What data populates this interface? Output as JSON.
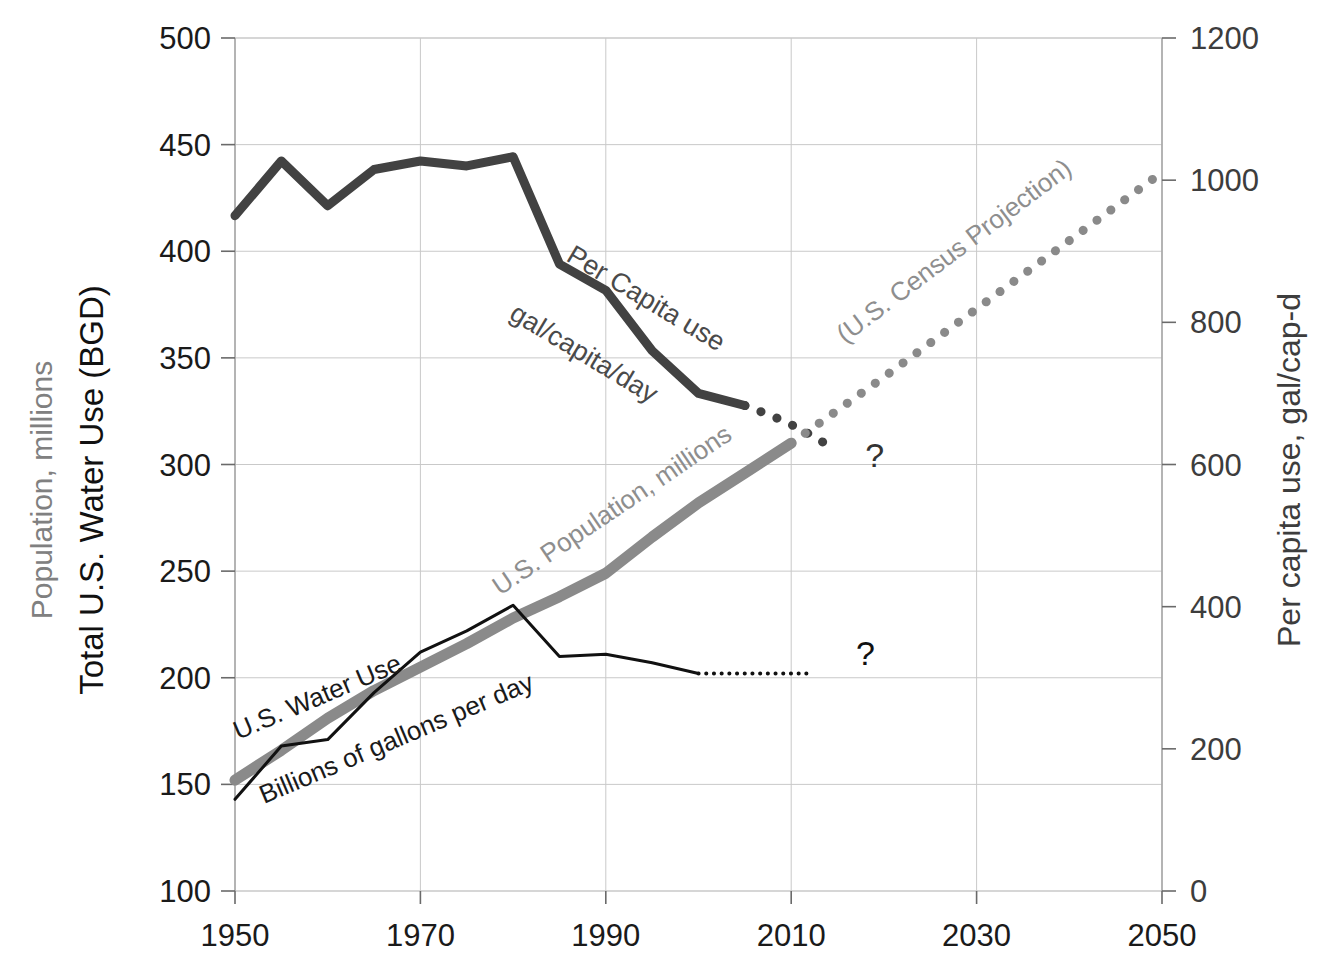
{
  "chart_data": {
    "type": "line",
    "title": "",
    "xlabel": "",
    "x_ticks": [
      "1950",
      "1970",
      "1990",
      "2010",
      "2030",
      "2050"
    ],
    "x_tick_values": [
      1950,
      1970,
      1990,
      2010,
      2030,
      2050
    ],
    "xlim": [
      1950,
      2050
    ],
    "grid": true,
    "legend": "inline-annotations",
    "axes": {
      "left": {
        "label_top": "Population, millions",
        "label_bottom": "Total U.S. Water Use (BGD)",
        "ticks": [
          "100",
          "150",
          "200",
          "250",
          "300",
          "350",
          "400",
          "450",
          "500"
        ],
        "tick_values": [
          100,
          150,
          200,
          250,
          300,
          350,
          400,
          450,
          500
        ],
        "ylim": [
          100,
          500
        ],
        "label_top_color": "#808080",
        "label_bottom_color": "#111111"
      },
      "right": {
        "label": "Per capita use, gal/cap-d",
        "ticks": [
          "0",
          "200",
          "400",
          "600",
          "800",
          "1000",
          "1200"
        ],
        "tick_values": [
          0,
          200,
          400,
          600,
          800,
          1000,
          1200
        ],
        "ylim": [
          0,
          1200
        ],
        "label_color": "#3d3d3d"
      }
    },
    "series": [
      {
        "name": "Per Capita use",
        "axis": "right",
        "units": "gal/capita/day",
        "color": "#424242",
        "style": "solid",
        "width": 9,
        "annotation_primary": "Per Capita use",
        "annotation_secondary": "gal/capita/day",
        "x": [
          1950,
          1955,
          1960,
          1965,
          1970,
          1975,
          1980,
          1985,
          1990,
          1995,
          2000,
          2005
        ],
        "values": [
          950,
          1027,
          964,
          1015,
          1027,
          1020,
          1033,
          882,
          845,
          760,
          700,
          683
        ]
      },
      {
        "name": "Per Capita use projection",
        "axis": "right",
        "color": "#424242",
        "style": "dotted",
        "width": 9,
        "x": [
          2005,
          2008,
          2011,
          2014
        ],
        "values": [
          683,
          668,
          650,
          627
        ]
      },
      {
        "name": "U.S. Population, millions",
        "axis": "left",
        "color": "#8a8a8a",
        "style": "solid",
        "width": 11,
        "annotation_primary": "U.S. Population, millions",
        "x": [
          1950,
          1955,
          1960,
          1965,
          1970,
          1975,
          1980,
          1985,
          1990,
          1995,
          2000,
          2005,
          2010
        ],
        "values": [
          152,
          166,
          181,
          194,
          205,
          216,
          228,
          238,
          249,
          266,
          282,
          296,
          310
        ]
      },
      {
        "name": "U.S. Census Projection",
        "axis": "left",
        "color": "#8a8a8a",
        "style": "dotted",
        "width": 9,
        "annotation_primary": "(U.S. Census Projection)",
        "x": [
          2010,
          2020,
          2030,
          2040,
          2050
        ],
        "values": [
          310,
          341,
          373,
          405,
          437
        ]
      },
      {
        "name": "U.S. Water Use",
        "axis": "left",
        "units": "Billions of gallons per day",
        "color": "#111111",
        "style": "solid",
        "width": 3,
        "annotation_primary": "U.S. Water Use",
        "annotation_secondary": "Billions of gallons per day",
        "x": [
          1950,
          1955,
          1960,
          1965,
          1970,
          1975,
          1980,
          1985,
          1990,
          1995,
          2000
        ],
        "values": [
          143,
          168,
          171,
          193,
          212,
          222,
          234,
          210,
          211,
          207,
          202
        ]
      },
      {
        "name": "U.S. Water Use projection",
        "axis": "left",
        "color": "#111111",
        "style": "dotted",
        "width": 4,
        "x": [
          2000,
          2004,
          2008,
          2012
        ],
        "values": [
          202,
          202,
          202,
          202
        ]
      }
    ],
    "annotations": [
      {
        "name": "per-capita-question-mark",
        "text": "?",
        "x": 2019,
        "y_left": 299,
        "color": "#333333"
      },
      {
        "name": "water-use-question-mark",
        "text": "?",
        "x": 2018,
        "y_left": 206,
        "color": "#111111"
      }
    ]
  }
}
